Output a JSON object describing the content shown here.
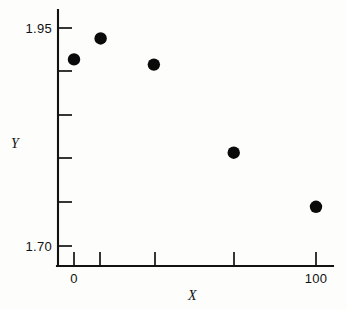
{
  "chart_data": {
    "type": "scatter",
    "title": "",
    "xlabel": "X",
    "ylabel": "Y",
    "x": [
      0,
      11,
      33,
      66,
      100
    ],
    "values": [
      1.914,
      1.938,
      1.908,
      1.807,
      1.745
    ],
    "points": [
      {
        "x": 0,
        "y": 1.914
      },
      {
        "x": 11,
        "y": 1.938
      },
      {
        "x": 33,
        "y": 1.908
      },
      {
        "x": 66,
        "y": 1.807
      },
      {
        "x": 100,
        "y": 1.745
      }
    ],
    "xlim": [
      -7,
      107
    ],
    "ylim": [
      1.7,
      1.96
    ],
    "x_ticks": [
      0,
      11,
      33,
      66,
      100
    ],
    "x_tick_labels": [
      "0",
      "",
      "",
      "",
      "100"
    ],
    "y_ticks": [
      1.95,
      1.9,
      1.85,
      1.8,
      1.75,
      1.7
    ],
    "y_tick_labels": [
      "1.95",
      "",
      "",
      "",
      "",
      "1.70"
    ],
    "grid": false,
    "legend": null,
    "marker": "filled-circle",
    "marker_color": "#0a0a0a",
    "axis_color": "#121212"
  },
  "axes": {
    "y_title": "Y",
    "x_title": "X",
    "y_labels": [
      {
        "text": "1.95",
        "value": 1.95
      },
      {
        "text": "1.70",
        "value": 1.7
      }
    ],
    "x_labels": [
      {
        "text": "0",
        "value": 0
      },
      {
        "text": "100",
        "value": 100
      }
    ]
  }
}
